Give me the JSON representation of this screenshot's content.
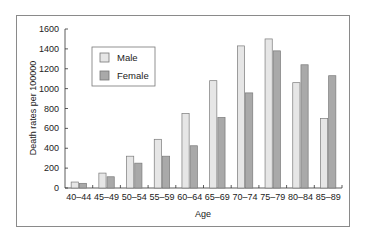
{
  "chart_data": {
    "type": "bar",
    "title": "",
    "xlabel": "Age",
    "ylabel": "Death rates per 100000",
    "ylim": [
      0,
      1600
    ],
    "yticks": [
      0,
      200,
      400,
      600,
      800,
      1000,
      1200,
      1400,
      1600
    ],
    "grid": false,
    "legend_position": "upper-left (inside plot)",
    "categories": [
      "40–44",
      "45–49",
      "50–54",
      "55–59",
      "60–64",
      "65–69",
      "70–74",
      "75–79",
      "80–84",
      "85–89"
    ],
    "series": [
      {
        "name": "Male",
        "color": "#e6e6e6",
        "values": [
          60,
          150,
          320,
          490,
          750,
          1080,
          1430,
          1500,
          1060,
          700
        ]
      },
      {
        "name": "Female",
        "color": "#a9a9a9",
        "values": [
          47,
          113,
          250,
          320,
          425,
          710,
          957,
          1380,
          1240,
          1130
        ]
      }
    ]
  },
  "legend": {
    "items": [
      {
        "label": "Male"
      },
      {
        "label": "Female"
      }
    ]
  },
  "axes": {
    "x_title": "Age",
    "y_title": "Death rates per 100000"
  }
}
